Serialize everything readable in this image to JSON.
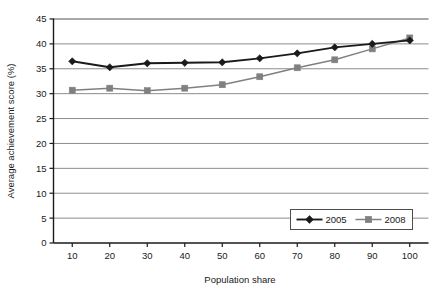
{
  "chart_data": {
    "type": "line",
    "title": "",
    "subtitle": "",
    "xlabel": "Population share",
    "ylabel": "Average achievement score (%)",
    "x": [
      10,
      20,
      30,
      40,
      50,
      60,
      70,
      80,
      90,
      100
    ],
    "xtick_labels": [
      "10",
      "20",
      "30",
      "40",
      "50",
      "60",
      "70",
      "80",
      "90",
      "100"
    ],
    "ytick_labels": [
      "0",
      "5",
      "10",
      "15",
      "20",
      "25",
      "30",
      "35",
      "40",
      "45"
    ],
    "yticks": [
      0,
      5,
      10,
      15,
      20,
      25,
      30,
      35,
      40,
      45
    ],
    "xlim": [
      5,
      105
    ],
    "ylim": [
      0,
      45
    ],
    "grid": "horizontal",
    "legend_position": "bottom-right",
    "series": [
      {
        "name": "2005",
        "marker": "diamond",
        "color": "#1a1a1a",
        "values": [
          36.5,
          35.3,
          36.1,
          36.2,
          36.3,
          37.1,
          38.1,
          39.3,
          40.0,
          40.7
        ]
      },
      {
        "name": "2008",
        "marker": "square",
        "color": "#808080",
        "values": [
          30.7,
          31.1,
          30.6,
          31.1,
          31.8,
          33.4,
          35.2,
          36.8,
          39.0,
          41.2
        ]
      }
    ]
  },
  "legend": {
    "entries": [
      {
        "label": "2005"
      },
      {
        "label": "2008"
      }
    ]
  },
  "colors": {
    "series_2005": "#1a1a1a",
    "series_2008": "#808080",
    "gridline": "#8c8c8c",
    "axis": "#1a1a1a",
    "background": "#ffffff"
  }
}
